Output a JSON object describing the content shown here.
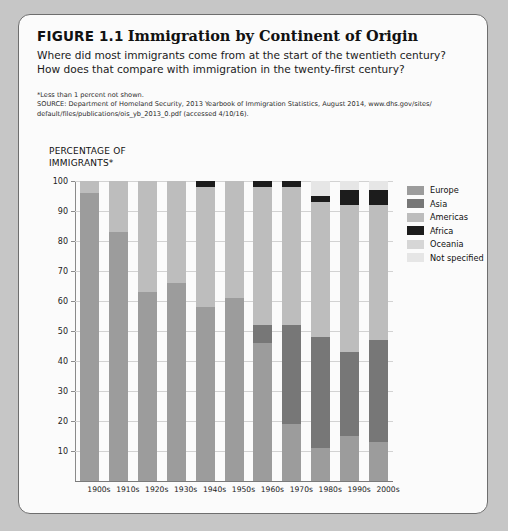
{
  "figure": {
    "number": "FIGURE 1.1",
    "title": "Immigration by Continent of Origin",
    "subtitle": "Where did most immigrants come from at the start of the twentieth century? How does that compare with immigration in the twenty-first century?",
    "footnote": "*Less than 1 percent not shown.",
    "source_line1": "SOURCE: Department of Homeland Security, 2013 Yearbook of Immigration Statistics, August 2014, www.dhs.gov/sites/",
    "source_line2": "default/files/publications/ois_yb_2013_0.pdf (accessed 4/10/16)."
  },
  "axis_title_line1": "PERCENTAGE OF",
  "axis_title_line2": "IMMIGRANTS*",
  "colors": {
    "europe": "#9c9c9c",
    "asia": "#777777",
    "americas": "#bdbdbd",
    "africa": "#1c1c1c",
    "oceania": "#d6d6d6",
    "not_specified": "#e6e6e6"
  },
  "chart_data": {
    "type": "bar",
    "stacked": true,
    "title": "Immigration by Continent of Origin",
    "xlabel": "",
    "ylabel": "PERCENTAGE OF IMMIGRANTS*",
    "ylim": [
      0,
      100
    ],
    "yticks": [
      10,
      20,
      30,
      40,
      50,
      60,
      70,
      80,
      90,
      100
    ],
    "grid": true,
    "legend_position": "right",
    "categories": [
      "1900s",
      "1910s",
      "1920s",
      "1930s",
      "1940s",
      "1950s",
      "1960s",
      "1970s",
      "1980s",
      "1990s",
      "2000s"
    ],
    "series": [
      {
        "name": "Europe",
        "color": "#9c9c9c",
        "values": [
          96,
          83,
          63,
          66,
          58,
          61,
          46,
          19,
          11,
          15,
          13
        ]
      },
      {
        "name": "Asia",
        "color": "#777777",
        "values": [
          0,
          0,
          0,
          0,
          0,
          0,
          6,
          33,
          37,
          28,
          34
        ]
      },
      {
        "name": "Americas",
        "color": "#bdbdbd",
        "values": [
          4,
          17,
          37,
          34,
          40,
          39,
          46,
          46,
          45,
          49,
          45
        ]
      },
      {
        "name": "Africa",
        "color": "#1c1c1c",
        "values": [
          0,
          0,
          0,
          0,
          2,
          0,
          2,
          2,
          2,
          5,
          5
        ]
      },
      {
        "name": "Oceania",
        "color": "#d6d6d6",
        "values": [
          0,
          0,
          0,
          0,
          0,
          0,
          0,
          0,
          0,
          0,
          0
        ]
      },
      {
        "name": "Not specified",
        "color": "#e6e6e6",
        "values": [
          0,
          0,
          0,
          0,
          0,
          0,
          0,
          0,
          5,
          3,
          3
        ]
      }
    ]
  },
  "legend": {
    "items": [
      {
        "label": "Europe",
        "color": "#9c9c9c"
      },
      {
        "label": "Asia",
        "color": "#777777"
      },
      {
        "label": "Americas",
        "color": "#bdbdbd"
      },
      {
        "label": "Africa",
        "color": "#1c1c1c"
      },
      {
        "label": "Oceania",
        "color": "#d6d6d6"
      },
      {
        "label": "Not specified",
        "color": "#e6e6e6"
      }
    ]
  }
}
